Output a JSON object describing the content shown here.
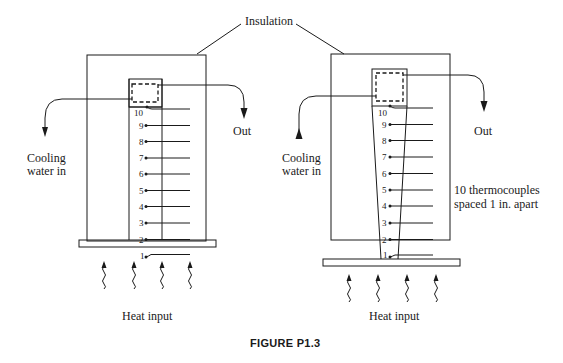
{
  "figure": {
    "caption": "FIGURE P1.3",
    "top_label": "Insulation",
    "left_apparatus": {
      "inlet_label_line1": "Cooling",
      "inlet_label_line2": "water in",
      "outlet_label": "Out",
      "bottom_label": "Heat input",
      "rod_shape": "uniform",
      "thermocouples": [
        "1",
        "2",
        "3",
        "4",
        "5",
        "6",
        "7",
        "8",
        "9",
        "10"
      ]
    },
    "right_apparatus": {
      "inlet_label_line1": "Cooling",
      "inlet_label_line2": "water in",
      "outlet_label": "Out",
      "bottom_label": "Heat input",
      "rod_shape": "tapered",
      "thermocouples": [
        "1",
        "2",
        "3",
        "4",
        "5",
        "6",
        "7",
        "8",
        "9",
        "10"
      ],
      "note_line1": "10 thermocouples",
      "note_line2": "spaced 1 in. apart"
    }
  },
  "colors": {
    "ink": "#1a1a1a",
    "background": "#ffffff"
  }
}
